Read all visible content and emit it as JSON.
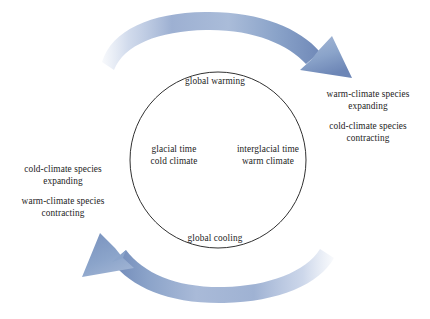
{
  "diagram": {
    "colors": {
      "arrow_dark": "#7089b8",
      "arrow_mid": "#9db0d2",
      "arrow_light": "#ccd7ea",
      "circle_stroke": "#1a1a1a",
      "text": "#232323",
      "background": "#ffffff"
    }
  },
  "cycle": {
    "circle": {
      "center_x": 218,
      "center_y": 160,
      "radius": 88
    },
    "top_arc_label": "global warming",
    "bottom_arc_label": "global cooling",
    "states": [
      {
        "id": "glacial",
        "lines": [
          "glacial time",
          "cold climate"
        ]
      },
      {
        "id": "interglacial",
        "lines": [
          "interglacial time",
          "warm climate"
        ]
      }
    ]
  },
  "arrows": [
    {
      "id": "warming-arrow",
      "direction": "clockwise",
      "position": "top",
      "points_to": "interglacial",
      "head": "down-right"
    },
    {
      "id": "cooling-arrow",
      "direction": "clockwise",
      "position": "bottom",
      "points_to": "glacial",
      "head": "up-left"
    }
  ],
  "responses": {
    "right": [
      {
        "id": "warm-expanding",
        "lines": [
          "warm-climate species",
          "expanding"
        ]
      },
      {
        "id": "cold-contracting",
        "lines": [
          "cold-climate species",
          "contracting"
        ]
      }
    ],
    "left": [
      {
        "id": "cold-expanding",
        "lines": [
          "cold-climate species",
          "expanding"
        ]
      },
      {
        "id": "warm-contracting",
        "lines": [
          "warm-climate species",
          "contracting"
        ]
      }
    ]
  }
}
